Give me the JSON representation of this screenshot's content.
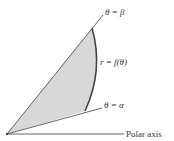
{
  "diagram": {
    "type": "polar-region",
    "labels": {
      "beta_ray": "θ = β",
      "alpha_ray": "θ = α",
      "curve": "r = f(θ)",
      "polar_axis": "Polar axis"
    },
    "colors": {
      "region_fill": "#d8d8d8",
      "curve": "#444444",
      "lines": "#555555",
      "text": "#333333"
    }
  }
}
